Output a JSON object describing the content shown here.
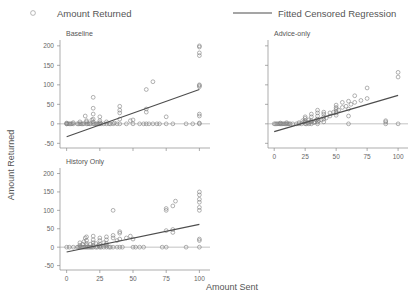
{
  "legend": {
    "position": "top",
    "entries": [
      {
        "label": "Amount Returned",
        "marker": "circle-outline-icon"
      },
      {
        "label": "Fitted Censored Regression",
        "marker": "line-icon"
      }
    ]
  },
  "axes": {
    "xlabel": "Amount Sent",
    "ylabel": "Amount Returned",
    "xticks": [
      "0",
      "25",
      "50",
      "75",
      "100"
    ],
    "yticks": [
      "-50",
      "0",
      "50",
      "100",
      "150",
      "200"
    ],
    "xlim": [
      -5,
      108
    ],
    "ylim": [
      -62,
      215
    ]
  },
  "chart_data": {
    "type": "scatter",
    "title": "",
    "xlabel": "Amount Sent",
    "ylabel": "Amount Returned",
    "xlim": [
      -5,
      108
    ],
    "ylim": [
      -62,
      215
    ],
    "xticks": [
      0,
      25,
      50,
      75,
      100
    ],
    "yticks": [
      -50,
      0,
      50,
      100,
      150,
      200
    ],
    "grid": false,
    "legend_position": "top",
    "legend": [
      "Amount Returned",
      "Fitted Censored Regression"
    ],
    "panels": [
      {
        "name": "Baseline",
        "show_xticklabels": false,
        "show_yticklabels": true,
        "censor_line_y": 0,
        "fit": {
          "intercept": -33,
          "slope": 1.21,
          "x0": 0,
          "x1": 100
        },
        "points": [
          [
            0,
            0
          ],
          [
            0,
            0
          ],
          [
            0,
            2
          ],
          [
            1,
            0
          ],
          [
            2,
            0
          ],
          [
            3,
            0
          ],
          [
            4,
            0
          ],
          [
            5,
            0
          ],
          [
            5,
            3
          ],
          [
            8,
            0
          ],
          [
            9,
            0
          ],
          [
            10,
            0
          ],
          [
            10,
            5
          ],
          [
            11,
            0
          ],
          [
            12,
            0
          ],
          [
            13,
            0
          ],
          [
            14,
            20
          ],
          [
            15,
            0
          ],
          [
            15,
            5
          ],
          [
            15,
            8
          ],
          [
            16,
            0
          ],
          [
            17,
            0
          ],
          [
            18,
            0
          ],
          [
            19,
            10
          ],
          [
            20,
            0
          ],
          [
            20,
            5
          ],
          [
            20,
            12
          ],
          [
            20,
            25
          ],
          [
            20,
            40
          ],
          [
            20,
            68
          ],
          [
            21,
            0
          ],
          [
            22,
            0
          ],
          [
            23,
            0
          ],
          [
            24,
            0
          ],
          [
            25,
            0
          ],
          [
            25,
            3
          ],
          [
            25,
            8
          ],
          [
            25,
            18
          ],
          [
            26,
            0
          ],
          [
            28,
            0
          ],
          [
            30,
            0
          ],
          [
            30,
            5
          ],
          [
            32,
            0
          ],
          [
            33,
            0
          ],
          [
            35,
            0
          ],
          [
            36,
            2
          ],
          [
            38,
            0
          ],
          [
            40,
            0
          ],
          [
            40,
            12
          ],
          [
            40,
            28
          ],
          [
            40,
            35
          ],
          [
            40,
            45
          ],
          [
            45,
            0
          ],
          [
            48,
            8
          ],
          [
            50,
            0
          ],
          [
            50,
            10
          ],
          [
            55,
            0
          ],
          [
            58,
            0
          ],
          [
            60,
            0
          ],
          [
            60,
            30
          ],
          [
            60,
            38
          ],
          [
            60,
            88
          ],
          [
            62,
            0
          ],
          [
            65,
            0
          ],
          [
            65,
            108
          ],
          [
            68,
            0
          ],
          [
            70,
            0
          ],
          [
            75,
            0
          ],
          [
            75,
            18
          ],
          [
            80,
            0
          ],
          [
            90,
            0
          ],
          [
            95,
            0
          ],
          [
            100,
            0
          ],
          [
            100,
            2
          ],
          [
            100,
            20
          ],
          [
            100,
            25
          ],
          [
            100,
            95
          ],
          [
            100,
            98
          ],
          [
            100,
            100
          ],
          [
            100,
            175
          ],
          [
            100,
            182
          ],
          [
            100,
            197
          ],
          [
            100,
            200
          ]
        ]
      },
      {
        "name": "Advice-only",
        "show_xticklabels": true,
        "show_yticklabels": false,
        "censor_line_y": 0,
        "fit": {
          "intercept": -20,
          "slope": 0.93,
          "x0": 0,
          "x1": 100
        },
        "points": [
          [
            0,
            0
          ],
          [
            1,
            0
          ],
          [
            2,
            0
          ],
          [
            3,
            0
          ],
          [
            4,
            0
          ],
          [
            5,
            0
          ],
          [
            5,
            2
          ],
          [
            6,
            0
          ],
          [
            7,
            0
          ],
          [
            8,
            0
          ],
          [
            9,
            0
          ],
          [
            10,
            0
          ],
          [
            10,
            3
          ],
          [
            11,
            0
          ],
          [
            12,
            0
          ],
          [
            13,
            0
          ],
          [
            15,
            0
          ],
          [
            18,
            0
          ],
          [
            20,
            0
          ],
          [
            20,
            3
          ],
          [
            22,
            0
          ],
          [
            23,
            8
          ],
          [
            24,
            5
          ],
          [
            25,
            0
          ],
          [
            25,
            5
          ],
          [
            25,
            8
          ],
          [
            25,
            14
          ],
          [
            25,
            18
          ],
          [
            26,
            0
          ],
          [
            27,
            3
          ],
          [
            28,
            0
          ],
          [
            28,
            10
          ],
          [
            29,
            5
          ],
          [
            30,
            0
          ],
          [
            30,
            5
          ],
          [
            30,
            8
          ],
          [
            30,
            18
          ],
          [
            30,
            25
          ],
          [
            32,
            3
          ],
          [
            33,
            5
          ],
          [
            34,
            10
          ],
          [
            35,
            0
          ],
          [
            35,
            5
          ],
          [
            35,
            12
          ],
          [
            35,
            20
          ],
          [
            35,
            28
          ],
          [
            35,
            35
          ],
          [
            36,
            8
          ],
          [
            38,
            10
          ],
          [
            40,
            5
          ],
          [
            40,
            12
          ],
          [
            40,
            18
          ],
          [
            40,
            25
          ],
          [
            40,
            30
          ],
          [
            42,
            15
          ],
          [
            45,
            20
          ],
          [
            45,
            28
          ],
          [
            48,
            30
          ],
          [
            50,
            22
          ],
          [
            50,
            28
          ],
          [
            50,
            32
          ],
          [
            50,
            38
          ],
          [
            50,
            42
          ],
          [
            50,
            48
          ],
          [
            52,
            35
          ],
          [
            55,
            42
          ],
          [
            55,
            55
          ],
          [
            58,
            45
          ],
          [
            60,
            0
          ],
          [
            60,
            20
          ],
          [
            60,
            38
          ],
          [
            60,
            58
          ],
          [
            62,
            50
          ],
          [
            65,
            55
          ],
          [
            65,
            72
          ],
          [
            70,
            60
          ],
          [
            75,
            65
          ],
          [
            75,
            92
          ],
          [
            90,
            0
          ],
          [
            90,
            5
          ],
          [
            90,
            8
          ],
          [
            100,
            0
          ],
          [
            100,
            120
          ],
          [
            100,
            132
          ]
        ]
      },
      {
        "name": "History Only",
        "show_xticklabels": true,
        "show_yticklabels": true,
        "censor_line_y": 0,
        "fit": {
          "intercept": -13,
          "slope": 0.75,
          "x0": 0,
          "x1": 100
        },
        "points": [
          [
            0,
            0
          ],
          [
            2,
            0
          ],
          [
            5,
            0
          ],
          [
            8,
            0
          ],
          [
            9,
            0
          ],
          [
            10,
            0
          ],
          [
            10,
            5
          ],
          [
            10,
            12
          ],
          [
            11,
            0
          ],
          [
            12,
            0
          ],
          [
            12,
            8
          ],
          [
            13,
            0
          ],
          [
            13,
            15
          ],
          [
            14,
            0
          ],
          [
            14,
            25
          ],
          [
            15,
            0
          ],
          [
            15,
            5
          ],
          [
            15,
            10
          ],
          [
            15,
            18
          ],
          [
            15,
            28
          ],
          [
            16,
            0
          ],
          [
            17,
            0
          ],
          [
            18,
            0
          ],
          [
            18,
            8
          ],
          [
            19,
            0
          ],
          [
            20,
            0
          ],
          [
            20,
            5
          ],
          [
            20,
            12
          ],
          [
            20,
            20
          ],
          [
            20,
            30
          ],
          [
            22,
            0
          ],
          [
            22,
            10
          ],
          [
            23,
            0
          ],
          [
            24,
            5
          ],
          [
            25,
            0
          ],
          [
            25,
            3
          ],
          [
            25,
            8
          ],
          [
            25,
            18
          ],
          [
            25,
            25
          ],
          [
            26,
            0
          ],
          [
            28,
            0
          ],
          [
            28,
            12
          ],
          [
            29,
            5
          ],
          [
            30,
            0
          ],
          [
            30,
            5
          ],
          [
            30,
            10
          ],
          [
            30,
            20
          ],
          [
            30,
            28
          ],
          [
            32,
            0
          ],
          [
            33,
            0
          ],
          [
            35,
            0
          ],
          [
            35,
            25
          ],
          [
            35,
            32
          ],
          [
            35,
            100
          ],
          [
            38,
            0
          ],
          [
            38,
            18
          ],
          [
            40,
            0
          ],
          [
            40,
            22
          ],
          [
            40,
            38
          ],
          [
            40,
            42
          ],
          [
            42,
            0
          ],
          [
            45,
            25
          ],
          [
            48,
            30
          ],
          [
            50,
            0
          ],
          [
            50,
            22
          ],
          [
            52,
            0
          ],
          [
            55,
            0
          ],
          [
            58,
            0
          ],
          [
            72,
            0
          ],
          [
            75,
            0
          ],
          [
            75,
            45
          ],
          [
            75,
            100
          ],
          [
            75,
            105
          ],
          [
            80,
            40
          ],
          [
            80,
            48
          ],
          [
            80,
            112
          ],
          [
            82,
            125
          ],
          [
            90,
            0
          ],
          [
            100,
            0
          ],
          [
            100,
            18
          ],
          [
            100,
            22
          ],
          [
            100,
            100
          ],
          [
            100,
            108
          ],
          [
            100,
            122
          ],
          [
            100,
            130
          ],
          [
            100,
            142
          ],
          [
            100,
            150
          ]
        ]
      }
    ]
  }
}
